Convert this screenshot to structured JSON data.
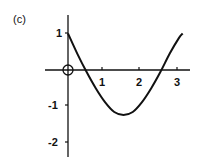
{
  "panel_label": "(c)",
  "chart_data": {
    "type": "line",
    "title": "",
    "xlabel": "",
    "ylabel": "",
    "xlim": [
      -0.6,
      3.2
    ],
    "ylim": [
      -2.6,
      1.5
    ],
    "grid": false,
    "x_ticks": [
      "1",
      "2",
      "3"
    ],
    "y_ticks": [
      "1",
      "-1",
      "-2"
    ],
    "annotations": [
      "open circle at origin"
    ],
    "x": [
      0,
      0.25,
      0.5,
      0.75,
      1.0,
      1.25,
      1.5,
      1.75,
      2.0,
      2.25,
      2.5,
      2.75,
      3.0,
      3.1
    ],
    "y": [
      1.0,
      0.45,
      -0.05,
      -0.5,
      -0.88,
      -1.15,
      -1.23,
      -1.15,
      -0.88,
      -0.5,
      -0.05,
      0.45,
      0.88,
      1.0
    ]
  }
}
